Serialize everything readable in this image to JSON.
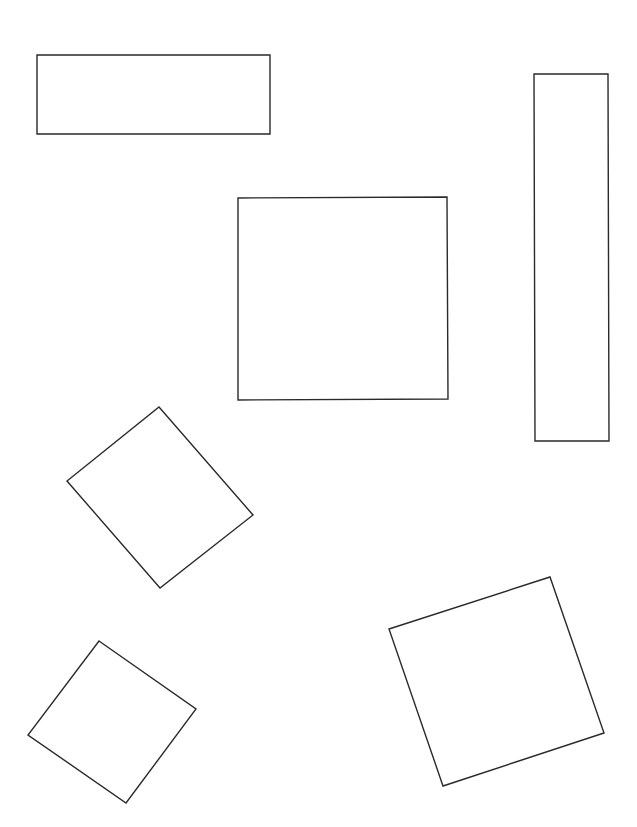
{
  "canvas": {
    "width": 637,
    "height": 827,
    "background": "#ffffff",
    "stroke_color": "#2a2a2a"
  },
  "shapes": [
    {
      "id": "wide-rectangle",
      "type": "rectangle",
      "points": "37,55 270,55 270,134 37,134"
    },
    {
      "id": "tall-rectangle",
      "type": "rectangle",
      "points": "534,74 608,74 609,441 535,441"
    },
    {
      "id": "center-square",
      "type": "square",
      "points": "238,198 447,197 448,399 238,400"
    },
    {
      "id": "rotated-square-middle-left",
      "type": "rotated-square",
      "points": "159,407 253,515 160,588 67,481"
    },
    {
      "id": "rotated-square-bottom-left",
      "type": "rotated-square",
      "points": "99,641 196,709 126,803 28,735"
    },
    {
      "id": "rotated-square-bottom-right",
      "type": "rotated-square",
      "points": "389,629 550,577 604,733 443,786"
    }
  ]
}
